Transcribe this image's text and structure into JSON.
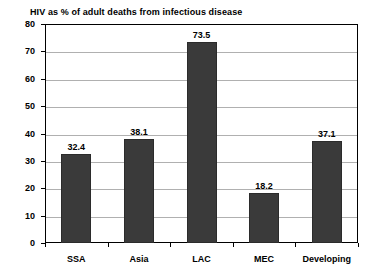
{
  "chart_data": {
    "type": "bar",
    "title": "HIV as % of adult deaths from infectious disease",
    "xlabel": "",
    "ylabel": "",
    "categories": [
      "SSA",
      "Asia",
      "LAC",
      "MEC",
      "Developing"
    ],
    "values": [
      32.4,
      38.1,
      73.5,
      18.2,
      37.1
    ],
    "value_labels": [
      "32.4",
      "38.1",
      "73.5",
      "18.2",
      "37.1"
    ],
    "ylim": [
      0,
      80
    ],
    "ytick_step": 10,
    "ytick_labels": [
      "0",
      "10",
      "20",
      "30",
      "40",
      "50",
      "60",
      "70",
      "80"
    ],
    "grid": true,
    "grid_orientation": "horizontal",
    "legend": false,
    "legend_position": "none",
    "bar_color": "#3a3a3a",
    "grid_color": "#b0b0b0",
    "axis_color": "#000000",
    "background_color": "#ffffff"
  }
}
